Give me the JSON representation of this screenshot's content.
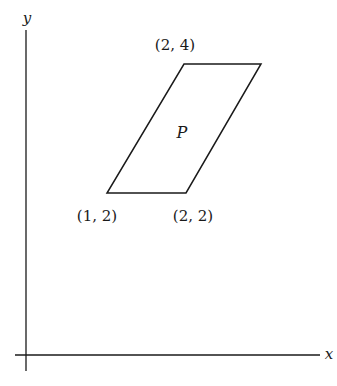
{
  "diagram": {
    "axes": {
      "x_label": "x",
      "y_label": "y"
    },
    "region": {
      "label": "P",
      "shape": "parallelogram"
    },
    "vertex_labels": [
      {
        "text": "(2, 4)",
        "position": "top-left vertex"
      },
      {
        "text": "(1, 2)",
        "position": "bottom-left vertex"
      },
      {
        "text": "(2, 2)",
        "position": "bottom-right vertex"
      }
    ],
    "colors": {
      "stroke": "#1a1a1a",
      "background": "#ffffff"
    }
  }
}
